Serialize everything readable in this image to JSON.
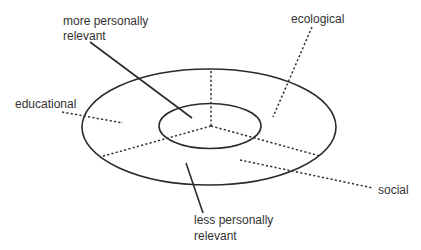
{
  "diagram": {
    "type": "concentric-ellipse-sector-diagram",
    "colors": {
      "stroke": "#2a2a2a",
      "text": "#333333",
      "background": "#ffffff"
    },
    "labels": {
      "more_relevant": {
        "line1": "more personally",
        "line2": "relevant"
      },
      "less_relevant": {
        "line1": "less personally",
        "line2": "relevant"
      },
      "educational": "educational",
      "ecological": "ecological",
      "social": "social"
    },
    "rings": [
      {
        "name": "inner",
        "meaning": "more personally relevant"
      },
      {
        "name": "outer",
        "meaning": "less personally relevant"
      }
    ],
    "sectors": [
      "educational",
      "ecological",
      "social"
    ]
  }
}
